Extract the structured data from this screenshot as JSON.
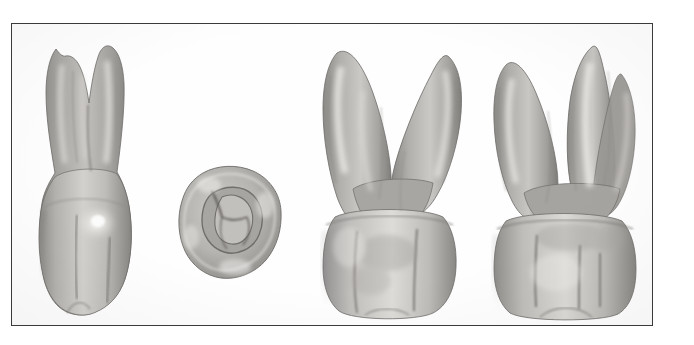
{
  "figure": {
    "kind": "photographic-plate",
    "subject": "maxillary first molar",
    "background_color": "#ffffff",
    "frame_color": "#3a3a3a",
    "frame": {
      "x": 11,
      "y": 23,
      "width": 642,
      "height": 303
    },
    "canvas": {
      "width": 694,
      "height": 345
    },
    "palette": {
      "enamel_light": "#d8d6d2",
      "enamel_mid": "#b9b7b3",
      "enamel_shadow": "#8e8c89",
      "root_mid": "#a9a7a3",
      "root_shadow": "#7d7b78",
      "groove": "#6a6865",
      "highlight": "#f2f1ee",
      "outline": "#6e6c69"
    },
    "views": [
      {
        "id": "view-buccal",
        "name": "buccal-view",
        "aspect": "buccal",
        "position": {
          "x": 28,
          "y": 30,
          "width": 118,
          "height": 286
        },
        "roots_visible": 3,
        "crown_cusps": 2,
        "notes": "two buccal cusps separated by buccal developmental groove; mesiobuccal and distobuccal roots with palatal root behind"
      },
      {
        "id": "view-occlusal",
        "name": "occlusal-view",
        "aspect": "occlusal",
        "position": {
          "x": 172,
          "y": 158,
          "width": 118,
          "height": 128
        },
        "roots_visible": 0,
        "crown_cusps": 4,
        "notes": "rhomboidal outline, central fossa, oblique ridge, central and buccal developmental grooves"
      },
      {
        "id": "view-mesial",
        "name": "mesial-view",
        "aspect": "mesial",
        "position": {
          "x": 312,
          "y": 30,
          "width": 154,
          "height": 288
        },
        "roots_visible": 2,
        "crown_cusps": 2,
        "notes": "widely divergent buccal and palatal roots, furcation visible"
      },
      {
        "id": "view-lingual",
        "name": "lingual-view",
        "aspect": "lingual",
        "position": {
          "x": 483,
          "y": 30,
          "width": 160,
          "height": 288
        },
        "roots_visible": 3,
        "crown_cusps": 2,
        "notes": "mesiolingual and distolingual cusps, lingual groove, three fine vertical surface grooves on crown"
      }
    ]
  }
}
